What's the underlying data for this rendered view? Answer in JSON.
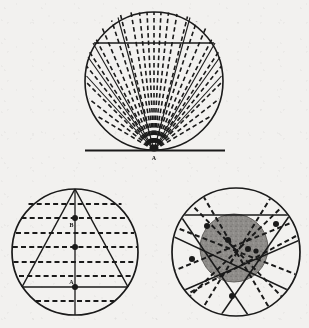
{
  "page": {
    "background_color": "#f2f1ef",
    "ink_color": "#1a1a1a",
    "shade_color": "#8f8d8a",
    "width": 309,
    "height": 328
  },
  "figures": [
    {
      "id": "figure-top",
      "name": "tangent-point-pencil-of-chords",
      "circle": {
        "cx": 154,
        "cy": 81,
        "r": 69
      },
      "tangent_line": {
        "x1": 85,
        "y1": 150,
        "x2": 225,
        "y2": 150
      },
      "vertex": {
        "x": 154,
        "y": 150,
        "label": "A"
      },
      "chord": {
        "x1": 95,
        "y1": 43,
        "x2": 213,
        "y2": 43,
        "style": "solid"
      },
      "label_a": "A",
      "dashed_ray_angles_deg": [
        -72,
        -58,
        -45,
        -33,
        -21,
        -10,
        0,
        10,
        21,
        33,
        45,
        58,
        72
      ],
      "solid_ray_angles_deg": [
        -84,
        -78,
        78,
        84
      ],
      "ray_style": "dashed",
      "note": "pencil of chords from tangency point A"
    },
    {
      "id": "figure-bottom-left",
      "name": "inscribed-triangle-with-parallel-chords",
      "circle": {
        "cx": 75,
        "cy": 252,
        "r": 63
      },
      "triangle": {
        "apex": {
          "x": 75,
          "y": 189
        },
        "left": {
          "x": 22,
          "y": 287
        },
        "right": {
          "x": 128,
          "y": 287
        }
      },
      "vertical_axis": {
        "x1": 75,
        "y1": 189,
        "x2": 75,
        "y2": 315
      },
      "solid_chord": {
        "x1": 22,
        "y1": 287,
        "x2": 128,
        "y2": 287
      },
      "dashed_chord_y": [
        204,
        218,
        233,
        247,
        262,
        276,
        301
      ],
      "points": [
        {
          "x": 75,
          "y": 218,
          "label": "B"
        },
        {
          "x": 75,
          "y": 247,
          "label": ""
        },
        {
          "x": 75,
          "y": 287,
          "label": "A"
        }
      ],
      "labels": [
        "B",
        "A"
      ]
    },
    {
      "id": "figure-bottom-right",
      "name": "shaded-inner-circle-with-secants",
      "circle": {
        "cx": 236,
        "cy": 252,
        "r": 64
      },
      "inner_circle": {
        "cx": 234,
        "cy": 248,
        "r": 34,
        "fill": "#8f8d8a"
      },
      "solid_chord": {
        "x1": 180,
        "y1": 215,
        "x2": 290,
        "y2": 215
      },
      "solid_lines": [
        {
          "x1": 180,
          "y1": 215,
          "x2": 248,
          "y2": 313
        },
        {
          "x1": 290,
          "y1": 215,
          "x2": 220,
          "y2": 313
        },
        {
          "x1": 175,
          "y1": 235,
          "x2": 288,
          "y2": 290
        },
        {
          "x1": 296,
          "y1": 238,
          "x2": 185,
          "y2": 292
        }
      ],
      "dashed_lines": [
        {
          "x1": 186,
          "y1": 199,
          "x2": 286,
          "y2": 300
        },
        {
          "x1": 288,
          "y1": 201,
          "x2": 186,
          "y2": 299
        },
        {
          "x1": 174,
          "y1": 268,
          "x2": 292,
          "y2": 222
        },
        {
          "x1": 176,
          "y1": 228,
          "x2": 296,
          "y2": 272
        },
        {
          "x1": 200,
          "y1": 192,
          "x2": 272,
          "y2": 312
        },
        {
          "x1": 272,
          "y1": 192,
          "x2": 200,
          "y2": 312
        }
      ],
      "points": [
        {
          "x": 207,
          "y": 226
        },
        {
          "x": 227,
          "y": 240
        },
        {
          "x": 247,
          "y": 248
        },
        {
          "x": 255,
          "y": 250
        },
        {
          "x": 275,
          "y": 224
        },
        {
          "x": 193,
          "y": 258
        },
        {
          "x": 232,
          "y": 295
        }
      ]
    }
  ],
  "labels": {
    "top_vertex": "A",
    "left_upper_point": "B",
    "left_lower_point": "A"
  }
}
